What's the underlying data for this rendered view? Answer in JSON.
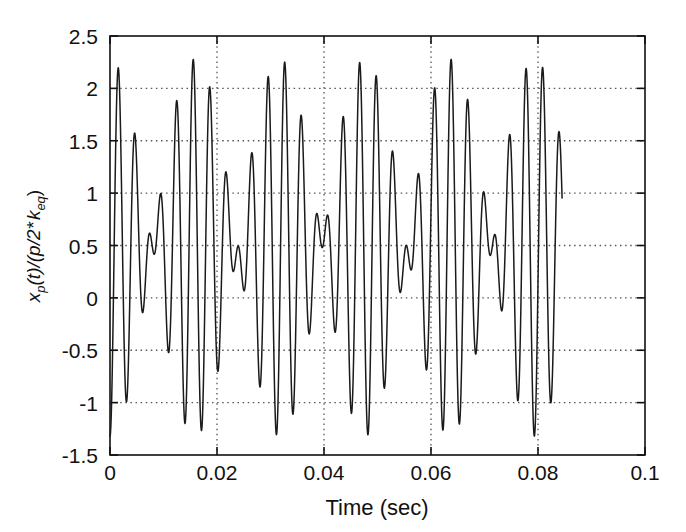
{
  "figure": {
    "background_color": "#ffffff",
    "line_color": "#1a1a1a",
    "grid_color": "#555555",
    "axis_color": "#111111"
  },
  "axis_labels": {
    "x_title": "Time (sec)",
    "y_title_parts": {
      "x": "x",
      "x_sub": "p",
      "mid": "(t)/(p/2*",
      "k": "k",
      "k_sub": "eq",
      "close": ")"
    },
    "y_title_plain": "x_p(t)/(p/2* k_eq)"
  },
  "ticks": {
    "x": [
      "0",
      "0.02",
      "0.04",
      "0.06",
      "0.08",
      "0.1"
    ],
    "y": [
      "2.5",
      "2",
      "1.5",
      "1",
      "0.5",
      "0",
      "-0.5",
      "-1",
      "-1.5"
    ]
  },
  "chart_data": {
    "type": "line",
    "title": "",
    "xlabel": "Time (sec)",
    "ylabel": "x_p(t)/(p/2* k_eq)",
    "xlim": [
      0,
      0.1
    ],
    "ylim": [
      -1.5,
      2.5
    ],
    "xticks": [
      0,
      0.02,
      0.04,
      0.06,
      0.08,
      0.1
    ],
    "yticks": [
      -1.5,
      -1,
      -0.5,
      0,
      0.5,
      1,
      1.5,
      2,
      2.5
    ],
    "grid": true,
    "grid_style": "dotted",
    "legend": "none",
    "series": [
      {
        "name": "x_p(t)/(p/2*k_eq)",
        "description": "Beating response: sum of two near-frequency sinusoids with a positive offset; alternating tall (~2.3) and short (~1.3) positive peaks with deep (~-1.33) troughs recurring at the beat period.",
        "model": {
          "offset": 0.48,
          "amplitude_a": 0.9,
          "amplitude_b": 0.9,
          "freq_a_hz": 290,
          "freq_b_hz": 353,
          "phase_a_rad": -1.5707963,
          "phase_b_rad": -1.5707963
        },
        "t_start": 0.0,
        "t_end": 0.0845,
        "sample_count": 1700,
        "major_peaks": [
          {
            "t": 0.004,
            "y": 2.3
          },
          {
            "t": 0.0199,
            "y": 2.31
          },
          {
            "t": 0.0358,
            "y": 2.3
          },
          {
            "t": 0.0517,
            "y": 2.29
          },
          {
            "t": 0.0676,
            "y": 2.3
          }
        ],
        "minor_peaks": [
          {
            "t": 0.0096,
            "y": 1.32
          },
          {
            "t": 0.0144,
            "y": 1.26
          },
          {
            "t": 0.0255,
            "y": 1.31
          },
          {
            "t": 0.0303,
            "y": 1.26
          },
          {
            "t": 0.0414,
            "y": 1.3
          },
          {
            "t": 0.0462,
            "y": 1.26
          },
          {
            "t": 0.0573,
            "y": 1.29
          },
          {
            "t": 0.0621,
            "y": 1.26
          },
          {
            "t": 0.0732,
            "y": 1.3
          },
          {
            "t": 0.079,
            "y": 1.21
          }
        ],
        "deep_troughs": [
          {
            "t": 0.012,
            "y": -1.33
          },
          {
            "t": 0.0279,
            "y": -1.33
          },
          {
            "t": 0.0438,
            "y": -1.31
          },
          {
            "t": 0.0597,
            "y": -1.34
          },
          {
            "t": 0.0756,
            "y": -1.33
          }
        ],
        "shallow_troughs": [
          {
            "t": 0.0008,
            "y": -0.34
          },
          {
            "t": 0.0068,
            "y": -0.3
          },
          {
            "t": 0.0172,
            "y": -0.33
          },
          {
            "t": 0.0227,
            "y": -0.3
          },
          {
            "t": 0.0331,
            "y": -0.33
          },
          {
            "t": 0.0386,
            "y": -0.3
          },
          {
            "t": 0.049,
            "y": -0.33
          },
          {
            "t": 0.0545,
            "y": -0.3
          },
          {
            "t": 0.0649,
            "y": -0.33
          },
          {
            "t": 0.0704,
            "y": -0.3
          }
        ],
        "start_point": {
          "t": 0.0,
          "y": 0.0
        },
        "end_point": {
          "t": 0.0845,
          "y": 0.4
        }
      }
    ]
  }
}
